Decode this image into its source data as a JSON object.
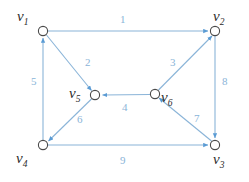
{
  "figure": {
    "type": "directed-graph",
    "background_color": "#ffffff",
    "edge_color": "#8ab4d8",
    "vertex_stroke_color": "#5a9bd4",
    "vertex_fill_color": "#ffffff",
    "vertex_label_color": "#2b2b2b",
    "edge_label_color": "#8ab4d8",
    "width": 249,
    "height": 182
  },
  "vertices": [
    {
      "id": "v1",
      "name": "v",
      "sub": "1",
      "cx": 43,
      "cy": 31,
      "r": 5,
      "label_x": 17,
      "label_y": 9
    },
    {
      "id": "v2",
      "name": "v",
      "sub": "2",
      "cx": 215,
      "cy": 31,
      "r": 5,
      "label_x": 213,
      "label_y": 9
    },
    {
      "id": "v3",
      "name": "v",
      "sub": "3",
      "cx": 215,
      "cy": 145,
      "r": 5,
      "label_x": 213,
      "label_y": 152
    },
    {
      "id": "v4",
      "name": "v",
      "sub": "4",
      "cx": 43,
      "cy": 145,
      "r": 5,
      "label_x": 16,
      "label_y": 151
    },
    {
      "id": "v5",
      "name": "v",
      "sub": "5",
      "cx": 95,
      "cy": 95,
      "r": 5,
      "label_x": 69,
      "label_y": 86
    },
    {
      "id": "v6",
      "name": "v",
      "sub": "6",
      "cx": 155,
      "cy": 94,
      "r": 5,
      "label_x": 161,
      "label_y": 90
    }
  ],
  "edges": [
    {
      "id": "e1",
      "label": "1",
      "from": "v1",
      "to": "v2",
      "label_x": 120,
      "label_y": 14
    },
    {
      "id": "e2",
      "label": "2",
      "from": "v1",
      "to": "v5",
      "label_x": 85,
      "label_y": 57
    },
    {
      "id": "e3",
      "label": "3",
      "from": "v6",
      "to": "v2",
      "label_x": 170,
      "label_y": 57
    },
    {
      "id": "e4",
      "label": "4",
      "from": "v6",
      "to": "v5",
      "label_x": 122,
      "label_y": 102
    },
    {
      "id": "e5",
      "label": "5",
      "from": "v4",
      "to": "v1",
      "label_x": 31,
      "label_y": 76
    },
    {
      "id": "e6",
      "label": "6",
      "from": "v5",
      "to": "v4",
      "label_x": 77,
      "label_y": 114
    },
    {
      "id": "e7",
      "label": "7",
      "from": "v3",
      "to": "v6",
      "label_x": 194,
      "label_y": 113
    },
    {
      "id": "e8",
      "label": "8",
      "from": "v2",
      "to": "v3",
      "label_x": 222,
      "label_y": 76
    },
    {
      "id": "e9",
      "label": "9",
      "from": "v4",
      "to": "v3",
      "label_x": 120,
      "label_y": 155
    }
  ]
}
